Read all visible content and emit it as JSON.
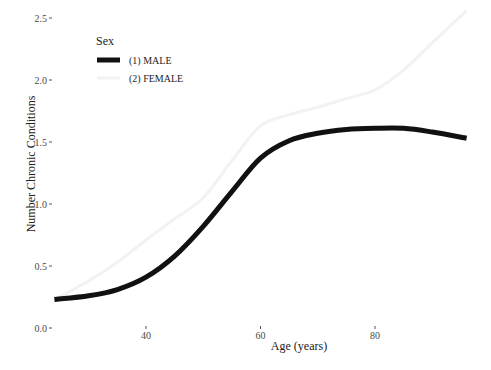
{
  "chart_data": {
    "type": "line",
    "title": "",
    "xlabel": "Age (years)",
    "ylabel": "Number Chronic Conditions",
    "xlim": [
      24,
      96
    ],
    "ylim": [
      0,
      2.5
    ],
    "x_ticks": [
      40,
      60,
      80
    ],
    "x_tick_labels": [
      "40",
      "60",
      "80"
    ],
    "y_ticks": [
      0.0,
      0.5,
      1.0,
      1.5,
      2.0,
      2.5
    ],
    "y_tick_labels": [
      "0.0",
      "0.5",
      "1.0",
      "1.5",
      "2.0",
      "2.5"
    ],
    "grid": false,
    "legend": {
      "title": "Sex",
      "position": "top-left inside",
      "entries": [
        "(1) MALE",
        "(2) FEMALE"
      ]
    },
    "x": [
      24,
      30,
      35,
      40,
      45,
      50,
      55,
      60,
      65,
      70,
      75,
      80,
      85,
      90,
      96
    ],
    "series": [
      {
        "name": "(1) MALE",
        "color": "#111111",
        "line_width": 5,
        "values": [
          0.23,
          0.26,
          0.31,
          0.41,
          0.58,
          0.82,
          1.1,
          1.37,
          1.51,
          1.57,
          1.6,
          1.61,
          1.61,
          1.58,
          1.53
        ]
      },
      {
        "name": "(2) FEMALE",
        "color": "#f2f2f2",
        "line_width": 3,
        "values": [
          0.23,
          0.38,
          0.53,
          0.71,
          0.88,
          1.05,
          1.35,
          1.63,
          1.72,
          1.78,
          1.85,
          1.92,
          2.08,
          2.3,
          2.56
        ]
      }
    ]
  }
}
